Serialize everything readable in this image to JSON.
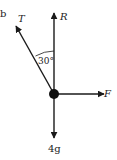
{
  "diagram": {
    "type": "free-body-diagram",
    "corner_label": "b",
    "forces": [
      {
        "name": "tension",
        "label": "T",
        "direction": "up-left"
      },
      {
        "name": "normal-reaction",
        "label": "R",
        "direction": "up"
      },
      {
        "name": "applied-force",
        "label": "F",
        "direction": "right"
      },
      {
        "name": "weight",
        "label": "4g",
        "direction": "down"
      }
    ],
    "angle": {
      "label": "30°",
      "between": [
        "T",
        "R"
      ]
    },
    "colors": {
      "line": "#1a1a1a",
      "text": "#222222",
      "background": "#ffffff"
    }
  }
}
